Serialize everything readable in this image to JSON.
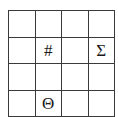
{
  "figure": {
    "type": "symbol-grid",
    "rows": 4,
    "columns": 4,
    "background_color": "#ffffff",
    "line_color": "#3a3a3a",
    "text_color": "#1a1a1a"
  },
  "grid": {
    "cells": [
      [
        {
          "label": "",
          "glyph_name": "empty"
        },
        {
          "label": "",
          "glyph_name": "empty"
        },
        {
          "label": "",
          "glyph_name": "empty"
        },
        {
          "label": "",
          "glyph_name": "empty"
        }
      ],
      [
        {
          "label": "",
          "glyph_name": "empty"
        },
        {
          "label": "#",
          "glyph_name": "number-sign"
        },
        {
          "label": "",
          "glyph_name": "empty"
        },
        {
          "label": "Σ",
          "glyph_name": "greek-capital-sigma"
        }
      ],
      [
        {
          "label": "",
          "glyph_name": "empty"
        },
        {
          "label": "",
          "glyph_name": "empty"
        },
        {
          "label": "",
          "glyph_name": "empty"
        },
        {
          "label": "",
          "glyph_name": "empty"
        }
      ],
      [
        {
          "label": "",
          "glyph_name": "empty"
        },
        {
          "label": "Θ",
          "glyph_name": "greek-capital-theta"
        },
        {
          "label": "",
          "glyph_name": "empty"
        },
        {
          "label": "",
          "glyph_name": "empty"
        }
      ]
    ]
  }
}
